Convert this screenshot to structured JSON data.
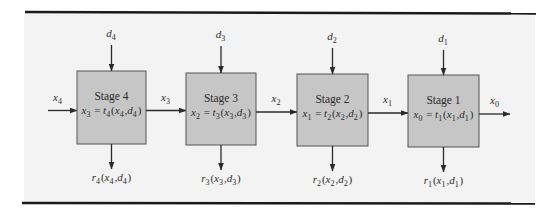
{
  "diagram": {
    "type": "serial-multistage-system",
    "colors": {
      "panel_background": "#f3f3f3",
      "rule": "#1a1a1a",
      "box_fill": "#c6c6c6",
      "box_border": "#555555",
      "arrow": "#2a2a2a",
      "text": "#2a2a2a"
    },
    "input_state": {
      "base": "x",
      "sub": "4"
    },
    "stages": [
      {
        "id": "stage-4",
        "title": "Stage 4",
        "equation": {
          "lhs": {
            "base": "x",
            "sub": "3"
          },
          "fn": {
            "base": "t",
            "sub": "4"
          },
          "args": [
            {
              "base": "x",
              "sub": "4"
            },
            {
              "base": "d",
              "sub": "4"
            }
          ]
        },
        "decision": {
          "base": "d",
          "sub": "4"
        },
        "return": {
          "fn": {
            "base": "r",
            "sub": "4"
          },
          "args": [
            {
              "base": "x",
              "sub": "4"
            },
            {
              "base": "d",
              "sub": "4"
            }
          ]
        },
        "output_state": {
          "base": "x",
          "sub": "3"
        }
      },
      {
        "id": "stage-3",
        "title": "Stage 3",
        "equation": {
          "lhs": {
            "base": "x",
            "sub": "2"
          },
          "fn": {
            "base": "t",
            "sub": "3"
          },
          "args": [
            {
              "base": "x",
              "sub": "3"
            },
            {
              "base": "d",
              "sub": "3"
            }
          ]
        },
        "decision": {
          "base": "d",
          "sub": "3"
        },
        "return": {
          "fn": {
            "base": "r",
            "sub": "3"
          },
          "args": [
            {
              "base": "x",
              "sub": "3"
            },
            {
              "base": "d",
              "sub": "3"
            }
          ]
        },
        "output_state": {
          "base": "x",
          "sub": "2"
        }
      },
      {
        "id": "stage-2",
        "title": "Stage 2",
        "equation": {
          "lhs": {
            "base": "x",
            "sub": "1"
          },
          "fn": {
            "base": "t",
            "sub": "2"
          },
          "args": [
            {
              "base": "x",
              "sub": "2"
            },
            {
              "base": "d",
              "sub": "2"
            }
          ]
        },
        "decision": {
          "base": "d",
          "sub": "2"
        },
        "return": {
          "fn": {
            "base": "r",
            "sub": "2"
          },
          "args": [
            {
              "base": "x",
              "sub": "2"
            },
            {
              "base": "d",
              "sub": "2"
            }
          ]
        },
        "output_state": {
          "base": "x",
          "sub": "1"
        }
      },
      {
        "id": "stage-1",
        "title": "Stage 1",
        "equation": {
          "lhs": {
            "base": "x",
            "sub": "0"
          },
          "fn": {
            "base": "t",
            "sub": "1"
          },
          "args": [
            {
              "base": "x",
              "sub": "1"
            },
            {
              "base": "d",
              "sub": "1"
            }
          ]
        },
        "decision": {
          "base": "d",
          "sub": "1"
        },
        "return": {
          "fn": {
            "base": "r",
            "sub": "1"
          },
          "args": [
            {
              "base": "x",
              "sub": "1"
            },
            {
              "base": "d",
              "sub": "1"
            }
          ]
        },
        "output_state": {
          "base": "x",
          "sub": "0"
        }
      }
    ]
  }
}
